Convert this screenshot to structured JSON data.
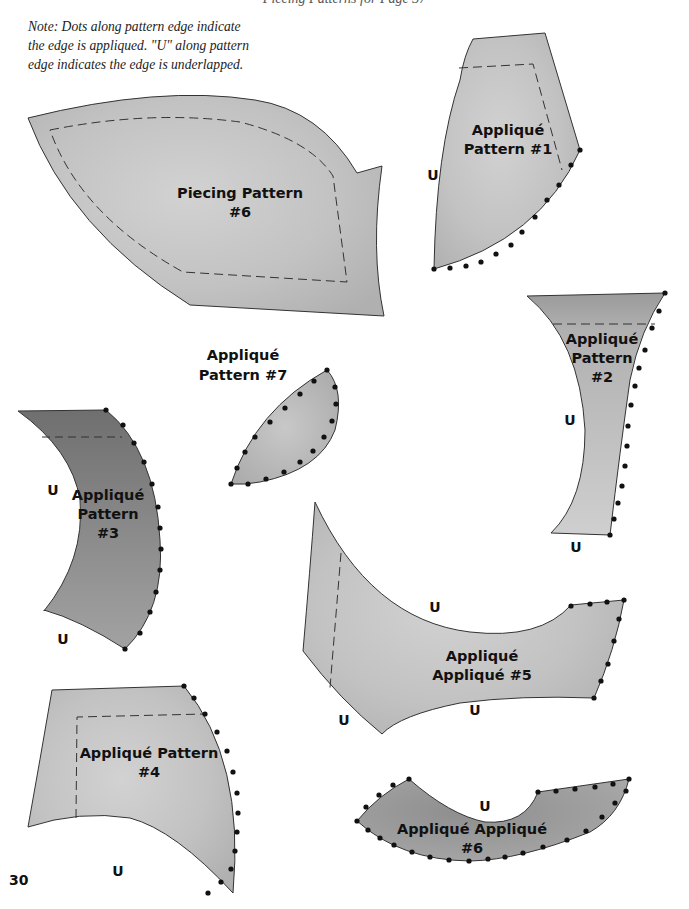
{
  "page": {
    "running_head": "Piecing Patterns for Page 37",
    "note": "Note: Dots along pattern edge indicate the edge is appliqued. \"U\" along pattern edge indicates the edge is underlapped.",
    "page_number": "30"
  },
  "patterns": {
    "piecing_6": {
      "line1": "Piecing Pattern",
      "line2": "#6"
    },
    "applique_1": {
      "line1": "Appliqué",
      "line2": "Pattern #1",
      "u_marks": [
        "U"
      ]
    },
    "applique_2": {
      "line1": "Appliqué",
      "line2": "Pattern",
      "line3": "#2",
      "u_marks": [
        "U",
        "U"
      ]
    },
    "applique_7": {
      "line1": "Appliqué",
      "line2": "Pattern #7"
    },
    "applique_3": {
      "line1": "Appliqué",
      "line2": "Pattern",
      "line3": "#3",
      "u_marks": [
        "U",
        "U"
      ]
    },
    "applique_5": {
      "line1": "Appliqué",
      "line2": "Appliqué #5",
      "u_marks": [
        "U",
        "U",
        "U"
      ]
    },
    "applique_4": {
      "line1": "Appliqué Pattern",
      "line2": "#4",
      "u_marks": [
        "U"
      ]
    },
    "applique_6": {
      "line1": "Appliqué Appliqué",
      "line2": "#6",
      "u_marks": [
        "U"
      ]
    }
  },
  "colors": {
    "fabric_light": "#c9c9c9",
    "fabric_mid": "#b3b3b3",
    "fabric_dark": "#8a8a8a",
    "outline": "#333333",
    "dot": "#111111"
  }
}
